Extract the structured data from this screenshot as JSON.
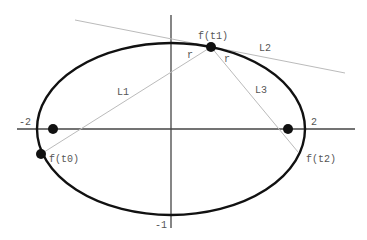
{
  "diagram": {
    "type": "ellipse-reflection",
    "colors": {
      "ellipse": "#111111",
      "axis": "#444444",
      "thin_line": "#bbbbbb",
      "point": "#111111",
      "label": "#555555"
    },
    "axes": {
      "x_min_label": "-2",
      "x_max_label": "2",
      "y_min_label": "-1"
    },
    "points": {
      "t0": "f(t0)",
      "t1": "f(t1)",
      "t2": "f(t2)"
    },
    "lines": {
      "l1": "L1",
      "l2": "L2",
      "l3": "L3"
    },
    "angles": {
      "left": "r",
      "right": "r"
    }
  }
}
